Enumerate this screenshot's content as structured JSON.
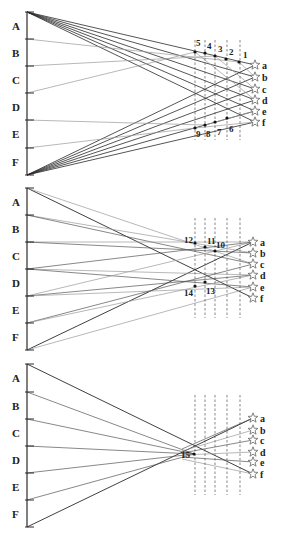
{
  "figure": {
    "panels": [
      {
        "id": "panel-1",
        "y0": 0,
        "source_labels": [
          "A",
          "B",
          "C",
          "D",
          "E",
          "F"
        ],
        "source_ticks_y": [
          12,
          39,
          66,
          93,
          120,
          148,
          175
        ],
        "bar_x": 27,
        "target_labels": [
          "a",
          "b",
          "c",
          "d",
          "e",
          "f"
        ],
        "target_x": 255,
        "target_y": [
          65,
          77,
          89,
          100,
          111,
          122
        ],
        "dashed_x": [
          195,
          205,
          215,
          227,
          240
        ],
        "dashed_y": [
          40,
          140
        ],
        "points": [
          {
            "label": "1",
            "x": 239,
            "y": 62,
            "lx": 243,
            "ly": 58
          },
          {
            "label": "2",
            "x": 226,
            "y": 59,
            "lx": 229,
            "ly": 55
          },
          {
            "label": "3",
            "x": 215,
            "y": 56,
            "lx": 218,
            "ly": 52
          },
          {
            "label": "4",
            "x": 205,
            "y": 53,
            "lx": 207,
            "ly": 49
          },
          {
            "label": "5",
            "x": 195,
            "y": 52,
            "lx": 196,
            "ly": 46
          },
          {
            "label": "6",
            "x": 227,
            "y": 118,
            "lx": 229,
            "ly": 132
          },
          {
            "label": "7",
            "x": 215,
            "y": 122,
            "lx": 217,
            "ly": 135
          },
          {
            "label": "8",
            "x": 205,
            "y": 125,
            "lx": 206,
            "ly": 137
          },
          {
            "label": "9",
            "x": 195,
            "y": 128,
            "lx": 196,
            "ly": 137
          }
        ]
      },
      {
        "id": "panel-2",
        "y0": 180,
        "source_labels": [
          "A",
          "B",
          "C",
          "D",
          "E",
          "F"
        ],
        "source_ticks_y": [
          188,
          215,
          242,
          269,
          296,
          323,
          350
        ],
        "bar_x": 27,
        "target_labels": [
          "a",
          "b",
          "c",
          "d",
          "e",
          "f"
        ],
        "target_x": 253,
        "target_y": [
          242,
          253,
          264,
          275,
          287,
          298
        ],
        "dashed_x": [
          195,
          205,
          215,
          227,
          240
        ],
        "dashed_y": [
          218,
          318
        ],
        "points": [
          {
            "label": "10",
            "x": 215,
            "y": 251,
            "lx": 216,
            "ly": 248
          },
          {
            "label": "11",
            "x": 205,
            "y": 247,
            "lx": 207,
            "ly": 244
          },
          {
            "label": "12",
            "x": 195,
            "y": 243,
            "lx": 184,
            "ly": 243
          },
          {
            "label": "13",
            "x": 205,
            "y": 282,
            "lx": 206,
            "ly": 294
          },
          {
            "label": "14",
            "x": 195,
            "y": 286,
            "lx": 184,
            "ly": 296
          }
        ]
      },
      {
        "id": "panel-3",
        "y0": 360,
        "source_labels": [
          "A",
          "B",
          "C",
          "D",
          "E",
          "F"
        ],
        "source_ticks_y": [
          364,
          392,
          419,
          446,
          473,
          500,
          527
        ],
        "bar_x": 27,
        "target_labels": [
          "a",
          "b",
          "c",
          "d",
          "e",
          "f"
        ],
        "target_x": 253,
        "target_y": [
          418,
          430,
          440,
          452,
          462,
          474
        ],
        "dashed_x": [
          195,
          205,
          215,
          227,
          240
        ],
        "dashed_y": [
          395,
          495
        ],
        "points": [
          {
            "label": "15",
            "x": 194,
            "y": 454,
            "lx": 181,
            "ly": 458
          }
        ]
      }
    ],
    "colors": {
      "line_dark": "#2a2a2a",
      "line_mid": "#555555",
      "line_light": "#9a9a9a",
      "dashed": "#555555",
      "star_stroke": "#666666",
      "text": "#222222"
    }
  }
}
